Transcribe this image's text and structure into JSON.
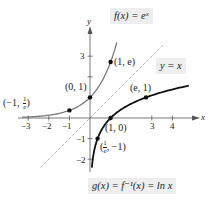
{
  "chart_data": {
    "type": "line",
    "title": "",
    "xlabel": "x",
    "ylabel": "y",
    "xlim": [
      -3.3,
      4.8
    ],
    "ylim": [
      -2.4,
      3.8
    ],
    "grid": false,
    "x_ticks": [
      -3,
      -2,
      -1,
      1,
      3,
      4
    ],
    "x_tick_labels": [
      "−3",
      "−2",
      "−1",
      "",
      "3",
      "4"
    ],
    "y_ticks": [
      3,
      2,
      1,
      -1,
      -2
    ],
    "y_tick_labels": [
      "3",
      "",
      "",
      "−1",
      "−2"
    ],
    "series": [
      {
        "name": "f(x) = e^x",
        "function": "exp(x)",
        "color": "#777777",
        "style": "solid",
        "x_range": [
          -3.3,
          1.3
        ]
      },
      {
        "name": "g(x) = f^-1(x) = ln x",
        "function": "ln(x)",
        "color": "#111111",
        "style": "solid",
        "x_range": [
          0.09,
          4.8
        ]
      },
      {
        "name": "y = x",
        "function": "x",
        "color": "#aaaaaa",
        "style": "dashed",
        "x_range": [
          -2.4,
          3.6
        ]
      }
    ],
    "points": [
      {
        "x": -1,
        "y": 0.3679,
        "label": "(−1, 1/e)"
      },
      {
        "x": 0,
        "y": 1,
        "label": "(0, 1)"
      },
      {
        "x": 1,
        "y": 2.7183,
        "label": "(1, e)"
      },
      {
        "x": 1,
        "y": 0,
        "label": "(1, 0)"
      },
      {
        "x": 2.7183,
        "y": 1,
        "label": "(e, 1)"
      },
      {
        "x": 0.3679,
        "y": -1,
        "label": "(1/e, −1)"
      }
    ]
  },
  "labels": {
    "f": "f(x) = eˣ",
    "line": "y = x",
    "g": "g(x) = f⁻¹(x) = ln x",
    "x_axis": "x",
    "y_axis": "y",
    "pt_neg1": "(−1,",
    "pt_neg1_frac_num": "1",
    "pt_neg1_frac_den": "e",
    "pt_neg1_close": ")",
    "pt_01": "(0, 1)",
    "pt_1e": "(1, e)",
    "pt_10": "(1, 0)",
    "pt_e1": "(e, 1)",
    "pt_inv_frac_num": "1",
    "pt_inv_frac_den": "e",
    "pt_inv_rest": ", −1)",
    "pt_inv_open": "(",
    "ticks": {
      "xm3": "−3",
      "xm2": "−2",
      "xm1": "−1",
      "x3": "3",
      "x4": "4",
      "y3": "3",
      "ym1": "−1",
      "ym2": "−2"
    }
  }
}
